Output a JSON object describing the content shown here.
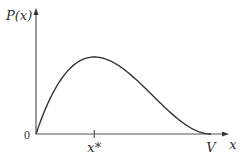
{
  "chart_data": {
    "type": "line",
    "title": "",
    "xlabel": "x",
    "ylabel": "P(x)",
    "origin_label": "0",
    "x_ticks": [
      {
        "value": 0.333,
        "label": "x*"
      },
      {
        "value": 1.0,
        "label": "V"
      }
    ],
    "xlim": [
      0,
      1.1
    ],
    "ylim": [
      0,
      1.4
    ],
    "grid": false,
    "legend": "none",
    "series": [
      {
        "name": "P(x)",
        "function": "x*(V-x)^2 normalized, V=1",
        "x": [
          0,
          0.05,
          0.1,
          0.15,
          0.2,
          0.25,
          0.3,
          0.333,
          0.4,
          0.45,
          0.5,
          0.55,
          0.6,
          0.65,
          0.7,
          0.75,
          0.8,
          0.85,
          0.9,
          0.95,
          1.0
        ],
        "y": [
          0,
          0.3,
          0.55,
          0.74,
          0.86,
          0.95,
          0.99,
          1.0,
          0.97,
          0.91,
          0.84,
          0.75,
          0.65,
          0.55,
          0.43,
          0.32,
          0.22,
          0.13,
          0.06,
          0.02,
          0
        ]
      }
    ],
    "color": "#333333"
  }
}
